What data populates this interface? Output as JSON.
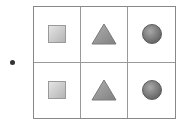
{
  "figure": {
    "bullet": true,
    "rows": 2,
    "columns": 3,
    "cells": [
      {
        "shape": "square",
        "row": 1,
        "col": 1,
        "color": "#c8c8c8"
      },
      {
        "shape": "triangle",
        "row": 1,
        "col": 2,
        "color": "#999999"
      },
      {
        "shape": "circle",
        "row": 1,
        "col": 3,
        "color": "#777777"
      },
      {
        "shape": "square",
        "row": 2,
        "col": 1,
        "color": "#c8c8c8"
      },
      {
        "shape": "triangle",
        "row": 2,
        "col": 2,
        "color": "#999999"
      },
      {
        "shape": "circle",
        "row": 2,
        "col": 3,
        "color": "#777777"
      }
    ],
    "border_color": "#888888"
  }
}
